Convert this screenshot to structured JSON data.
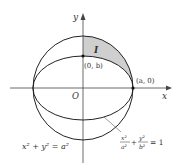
{
  "diagram": {
    "type": "geometry",
    "axes": {
      "x_label": "x",
      "y_label": "y",
      "origin_label": "O"
    },
    "points": [
      {
        "label": "(0, b)",
        "x": "0",
        "y": "b"
      },
      {
        "label": "(a, 0)",
        "x": "a",
        "y": "0"
      }
    ],
    "region_label": "I",
    "circle_equation": "x² + y² = a²",
    "ellipse_equation": {
      "x_num": "x²",
      "x_den": "a²",
      "y_num": "y²",
      "y_den": "b²",
      "rhs": "= 1",
      "plus": "+"
    },
    "colors": {
      "shaded_region": "#cfcfcf",
      "curves": "#222222",
      "axes": "#444444"
    }
  }
}
